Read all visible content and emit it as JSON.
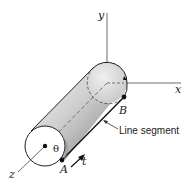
{
  "figure": {
    "axes": {
      "x_label": "x",
      "y_label": "y",
      "z_label": "z"
    },
    "points": {
      "a_label": "A",
      "b_label": "B"
    },
    "angle_label": "θ",
    "tangent_label": "t",
    "annotation": "Line segment",
    "colors": {
      "line": "#333333",
      "cylinder_light": "#e4e4e4",
      "cylinder_dark": "#8a8a8a",
      "background": "#ffffff"
    }
  }
}
